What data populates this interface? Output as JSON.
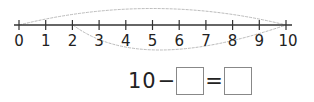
{
  "number_line": {
    "min": 0,
    "max": 10,
    "labels": [
      "0",
      "1",
      "2",
      "3",
      "4",
      "5",
      "6",
      "7",
      "8",
      "9",
      "10"
    ],
    "upper_arc": {
      "from": 0,
      "to": 10
    },
    "lower_arc": {
      "from": 2,
      "to": 10
    }
  },
  "equation": {
    "minuend": "10",
    "minus": "−",
    "equals": "=",
    "subtrahend_box": "",
    "result_box": ""
  },
  "colors": {
    "line": "#333333",
    "arc": "#bbbbbb",
    "box_border": "#888888"
  }
}
